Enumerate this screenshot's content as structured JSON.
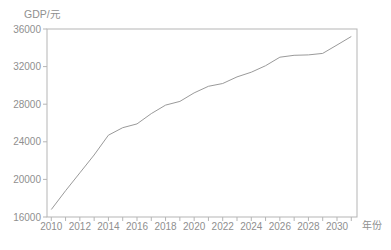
{
  "figure": {
    "background": "#ffffff"
  },
  "chart_data": {
    "type": "line",
    "title": "",
    "xlabel": "年份",
    "ylabel": "GDP/元",
    "x": [
      2010,
      2011,
      2012,
      2013,
      2014,
      2015,
      2016,
      2017,
      2018,
      2019,
      2020,
      2021,
      2022,
      2023,
      2024,
      2025,
      2026,
      2027,
      2028,
      2029,
      2030,
      2031
    ],
    "values": [
      16800,
      18800,
      20700,
      22600,
      24700,
      25500,
      25900,
      27000,
      27900,
      28300,
      29200,
      29900,
      30200,
      30900,
      31400,
      32100,
      33000,
      33200,
      33250,
      33400,
      34300,
      35200
    ],
    "series_name": "GDP forecast",
    "xlim": [
      2009.7,
      2031.4
    ],
    "ylim": [
      16000,
      36000
    ],
    "xticks": [
      2010,
      2012,
      2014,
      2016,
      2018,
      2020,
      2022,
      2024,
      2026,
      2028,
      2030
    ],
    "minor_xtick_start": 2010,
    "minor_xtick_end": 2031,
    "minor_xtick_step": 1,
    "yticks": [
      16000,
      20000,
      24000,
      28000,
      32000,
      36000
    ],
    "grid": false,
    "legend": "none",
    "line_color": "#9a9a9a",
    "axis_color": "#b5b5b5",
    "tick_label_color": "#8f8f8f",
    "plot_background": "#ffffff"
  }
}
